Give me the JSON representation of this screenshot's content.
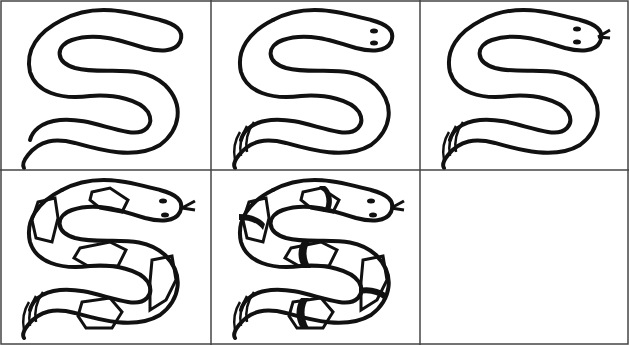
{
  "grid": {
    "rows": 2,
    "cols": 3,
    "line_color": "#444444",
    "ink_color": "#111111"
  },
  "steps": [
    {
      "step": 1,
      "description": "S-shaped body outline"
    },
    {
      "step": 2,
      "description": "Add eyes and rattle/tail stripes"
    },
    {
      "step": 3,
      "description": "Add forked tongue"
    },
    {
      "step": 4,
      "description": "Add hexagon pattern on body"
    },
    {
      "step": 5,
      "description": "Add dark bands between hexagons"
    },
    {
      "step": 6,
      "description": ""
    }
  ]
}
